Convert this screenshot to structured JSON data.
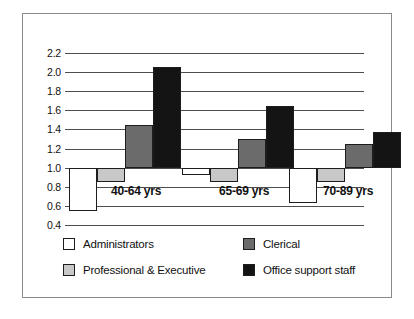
{
  "chart_data": {
    "type": "bar",
    "title": "",
    "subtitle": "",
    "xlabel": "",
    "ylabel": "",
    "ylim": [
      0.4,
      2.2
    ],
    "ytick_labels": [
      "2.2",
      "2.0",
      "1.8",
      "1.6",
      "1.4",
      "1.2",
      "1.0",
      "0.8",
      "0.6",
      "0.4"
    ],
    "ytick_values": [
      2.2,
      2.0,
      1.8,
      1.6,
      1.4,
      1.2,
      1.0,
      0.8,
      0.6,
      0.4
    ],
    "baseline": 1.0,
    "grid": true,
    "legend_position": "bottom",
    "categories": [
      "40-64 yrs",
      "65-69 yrs",
      "70-89 yrs"
    ],
    "series": [
      {
        "name": "Administrators",
        "color": "#ffffff",
        "values": [
          0.55,
          0.92,
          0.63
        ]
      },
      {
        "name": "Professional & Executive",
        "color": "#c8c8c8",
        "values": [
          0.85,
          0.85,
          0.85
        ]
      },
      {
        "name": "Clerical",
        "color": "#6b6b6b",
        "values": [
          1.45,
          1.3,
          1.25
        ]
      },
      {
        "name": "Office support staff",
        "color": "#141414",
        "values": [
          2.05,
          1.65,
          1.37
        ]
      }
    ]
  },
  "legend": {
    "items": [
      {
        "label": "Administrators",
        "swatch": "#ffffff"
      },
      {
        "label": "Professional & Executive",
        "swatch": "#c8c8c8"
      },
      {
        "label": "Clerical",
        "swatch": "#6b6b6b"
      },
      {
        "label": "Office support staff",
        "swatch": "#141414"
      }
    ]
  },
  "frame": {
    "border_color": "#8a8a8a"
  }
}
